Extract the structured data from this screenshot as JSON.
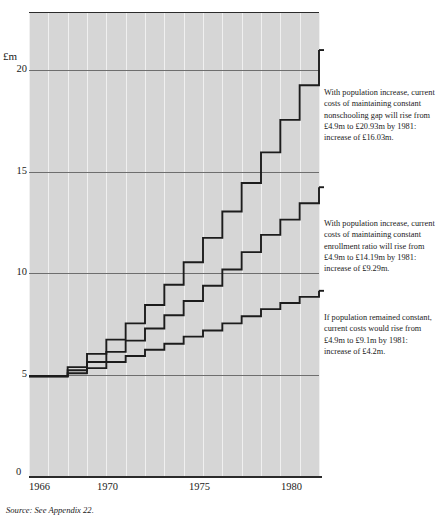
{
  "figure": {
    "unit_label": "£m",
    "source_note": "Source:  See Appendix 22."
  },
  "axes": {
    "y_ticks": [
      "20",
      "15",
      "10",
      "5"
    ],
    "zero_label": "0",
    "x_ticks": [
      "1966",
      "1970",
      "1975",
      "1980"
    ]
  },
  "annotations": {
    "nonschooling_gap": "With population increase, current costs of maintaining constant nonschooling gap will rise from £4.9m to £20.93m by 1981: increase of £16.03m.",
    "enrollment_ratio": "With population increase, current costs of maintaining constant enrollment ratio will rise from £4.9m to £14.19m by 1981: increase of £9.29m.",
    "constant_population": "If population remained constant, current costs would rise from £4.9m to £9.1m by 1981: increase of £4.2m."
  },
  "chart_data": {
    "type": "line",
    "title": "",
    "xlabel": "",
    "ylabel": "£m",
    "xlim": [
      1966,
      1981
    ],
    "ylim": [
      0,
      22.8
    ],
    "grid": true,
    "step": "post",
    "legend_position": "right-annotations",
    "x": [
      1966,
      1967,
      1968,
      1969,
      1970,
      1971,
      1972,
      1973,
      1974,
      1975,
      1976,
      1977,
      1978,
      1979,
      1980,
      1981
    ],
    "series": [
      {
        "name": "Constant nonschooling gap (with population increase)",
        "start_value": 4.9,
        "end_value": 20.93,
        "increase": 16.03,
        "values": [
          4.9,
          4.9,
          5.35,
          6.0,
          6.7,
          7.5,
          8.4,
          9.4,
          10.5,
          11.7,
          13.0,
          14.4,
          15.9,
          17.5,
          19.2,
          20.93
        ]
      },
      {
        "name": "Constant enrollment ratio (with population increase)",
        "start_value": 4.9,
        "end_value": 14.19,
        "increase": 9.29,
        "values": [
          4.9,
          4.9,
          5.2,
          5.6,
          6.1,
          6.65,
          7.25,
          7.9,
          8.6,
          9.35,
          10.15,
          11.0,
          11.85,
          12.6,
          13.4,
          14.19
        ]
      },
      {
        "name": "Constant population",
        "start_value": 4.9,
        "end_value": 9.1,
        "increase": 4.2,
        "values": [
          4.9,
          4.9,
          5.05,
          5.3,
          5.6,
          5.9,
          6.2,
          6.5,
          6.85,
          7.15,
          7.5,
          7.85,
          8.2,
          8.5,
          8.8,
          9.1
        ]
      }
    ],
    "y_tick_values": [
      5,
      10,
      15,
      20
    ],
    "x_tick_values": [
      1966,
      1970,
      1975,
      1980
    ],
    "colors": {
      "plot_background": "#d6d6d6",
      "line": "#1c1c1c",
      "gridline_h": "#6e6e6e",
      "gridline_v": "#f0f0f0"
    }
  }
}
